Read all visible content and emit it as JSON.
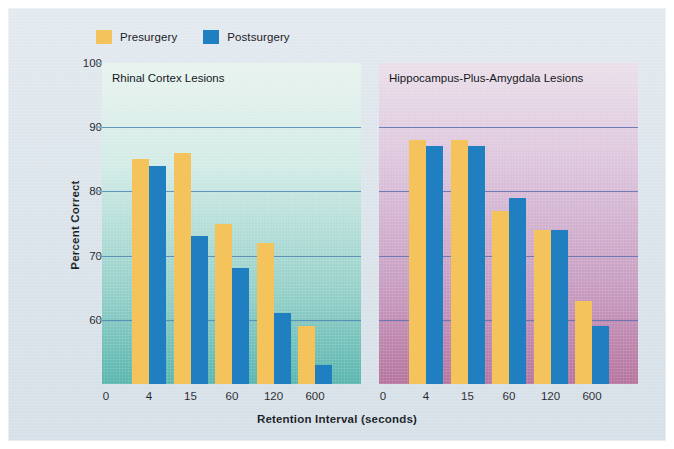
{
  "chart_data": {
    "type": "bar",
    "title": "",
    "xlabel": "Retention Interval (seconds)",
    "ylabel": "Percent Correct",
    "categories": [
      "0",
      "4",
      "15",
      "60",
      "120",
      "600"
    ],
    "ylim": [
      50,
      100
    ],
    "yticks": [
      60,
      70,
      80,
      90,
      100
    ],
    "gridlines": [
      60,
      70,
      80,
      90
    ],
    "grid": true,
    "legend_position": "top-left",
    "legend": [
      {
        "name": "Presurgery",
        "color": "#f5c35c"
      },
      {
        "name": "Postsurgery",
        "color": "#1f7fc0"
      }
    ],
    "panels": [
      {
        "title": "Rhinal Cortex Lesions",
        "series": [
          {
            "name": "Presurgery",
            "values": [
              85,
              86,
              75,
              72,
              59
            ]
          },
          {
            "name": "Postsurgery",
            "values": [
              84,
              73,
              68,
              61,
              53
            ]
          }
        ],
        "bar_categories": [
          "4",
          "15",
          "60",
          "120",
          "600"
        ]
      },
      {
        "title": "Hippocampus-Plus-Amygdala Lesions",
        "series": [
          {
            "name": "Presurgery",
            "values": [
              88,
              88,
              77,
              74,
              63
            ]
          },
          {
            "name": "Postsurgery",
            "values": [
              87,
              87,
              79,
              74,
              59
            ]
          }
        ],
        "bar_categories": [
          "4",
          "15",
          "60",
          "120",
          "600"
        ]
      }
    ]
  },
  "axes": {
    "ylabel": "Percent Correct",
    "xlabel": "Retention Interval (seconds)",
    "ytick_labels": [
      "100",
      "90",
      "80",
      "70",
      "60"
    ],
    "xtick_labels": [
      "0",
      "4",
      "15",
      "60",
      "120",
      "600"
    ]
  },
  "legend": {
    "presurgery_label": "Presurgery",
    "postsurgery_label": "Postsurgery",
    "presurgery_color": "#f5c35c",
    "postsurgery_color": "#1f7fc0"
  },
  "panels": {
    "left_title": "Rhinal Cortex Lesions",
    "right_title": "Hippocampus-Plus-Amygdala Lesions"
  }
}
